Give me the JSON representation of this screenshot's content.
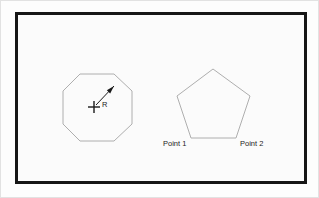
{
  "page": {
    "background_color": "#fdfdfd",
    "outer_border_color": "#e2e2e2"
  },
  "drawing_frame": {
    "name": "drawing-border",
    "border_color": "#161616",
    "border_width_px": 3,
    "fill_color": "#fbfbfb",
    "x": 14,
    "y": 11,
    "width": 292,
    "height": 172
  },
  "style": {
    "shape_stroke_color": "#aeaeae",
    "annotation_color": "#1a1a1a",
    "text_color": "#1c1c1c"
  },
  "shapes": [
    {
      "id": "octagon",
      "name": "octagon-shape",
      "sides": 8,
      "center": {
        "x": 96,
        "y": 106
      },
      "circumradius": 36,
      "points": "79,73 113,73 131,90 131,123 113,140 79,140 62,123 62,90"
    },
    {
      "id": "pentagon",
      "name": "pentagon-shape",
      "sides": 5,
      "center": {
        "x": 212,
        "y": 110
      },
      "circumradius": 43,
      "points": "212,68 249,95 235,137 190,137 176,95"
    }
  ],
  "annotations": {
    "center_mark": {
      "name": "center-cross-mark",
      "x": 93,
      "y": 106,
      "arm_length": 6
    },
    "radius_leader": {
      "name": "radius-leader-arrow",
      "from": {
        "x": 95,
        "y": 104
      },
      "to": {
        "x": 113,
        "y": 85
      },
      "arrow_at": "to"
    }
  },
  "labels": [
    {
      "id": "radius-label",
      "name": "radius-label",
      "text": "R",
      "x": 101,
      "y": 106,
      "anchor": "start"
    },
    {
      "id": "point-1-label",
      "name": "point-1-label",
      "text": "Point 1",
      "x": 162,
      "y": 145,
      "anchor": "start"
    },
    {
      "id": "point-2-label",
      "name": "point-2-label",
      "text": "Point 2",
      "x": 239,
      "y": 145,
      "anchor": "start"
    }
  ]
}
